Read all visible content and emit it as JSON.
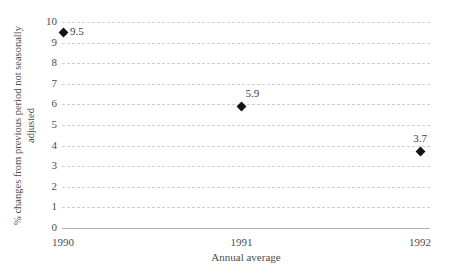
{
  "chart_data": {
    "type": "scatter",
    "title": "",
    "x": [
      1990,
      1991,
      1992
    ],
    "values": [
      9.5,
      5.9,
      3.7
    ],
    "point_labels": [
      "9.5",
      "5.9",
      "3.7"
    ],
    "point_label_positions": [
      "right",
      "above-right",
      "above"
    ],
    "xticks": [
      "1990",
      "1991",
      "1992"
    ],
    "yticks": [
      0,
      1,
      2,
      3,
      4,
      5,
      6,
      7,
      8,
      9,
      10
    ],
    "ylim": [
      0,
      10
    ],
    "xlabel": "Annual average",
    "ylabel": "% changes from previous period not seasonally adjusted",
    "ylabel_lines": [
      "% changes from previous period not seasonally",
      "adjusted"
    ],
    "grid": "horizontal-dashed",
    "legend": "none",
    "marker": "diamond",
    "colors": {
      "marker": "#141414",
      "text": "#4d4d4d",
      "point_label_text": "#3d3d3d",
      "gridline": "#cfcfcf",
      "zero_line": "#b3b3b3",
      "background": "#ffffff"
    }
  }
}
